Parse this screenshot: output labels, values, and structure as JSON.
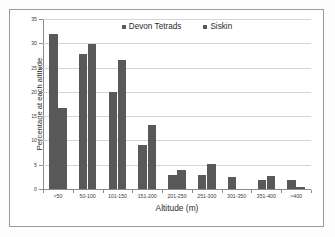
{
  "chart_data": {
    "type": "bar",
    "title": "",
    "xlabel": "Altitude (m)",
    "ylabel": "Percentage at each altitude",
    "categories": [
      "<50",
      "50-100",
      "101-150",
      "151-200",
      "201-250",
      "251-300",
      "301-350",
      "351-400",
      ">400"
    ],
    "series": [
      {
        "name": "Devon Tetrads",
        "color": "#595959",
        "values": [
          32.0,
          27.7,
          20.0,
          9.1,
          2.9,
          2.9,
          2.4,
          1.9,
          1.8
        ]
      },
      {
        "name": "Siskin",
        "color": "#595959",
        "values": [
          16.7,
          29.9,
          26.5,
          13.1,
          3.9,
          5.2,
          0.0,
          2.6,
          0.5
        ]
      }
    ],
    "ylim": [
      0,
      35
    ],
    "yticks": [
      0,
      5,
      10,
      15,
      20,
      25,
      30,
      35
    ],
    "ytick_labels": [
      "0",
      "5",
      "10",
      "15",
      "20",
      "25",
      "30",
      "35"
    ],
    "grid": "horizontal",
    "legend_position": "top-center"
  },
  "axes": {
    "y_title": "Percentage at each altitude",
    "x_title": "Altitude (m)"
  },
  "legend": {
    "entries": [
      {
        "label": "Devon Tetrads"
      },
      {
        "label": "Siskin"
      }
    ]
  },
  "colors": {
    "bar": "#595959",
    "grid": "#d4d4d4",
    "axis": "#8c8c8c",
    "frame": "#9a9a9a",
    "background": "#ffffff",
    "text": "#2b2b2b"
  }
}
